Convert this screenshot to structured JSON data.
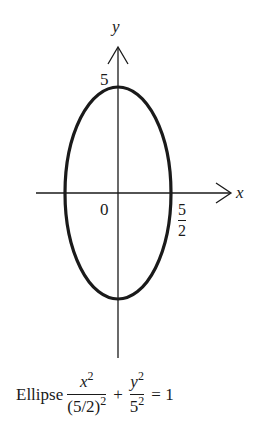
{
  "diagram": {
    "type": "ellipse-plot",
    "center": [
      0,
      0
    ],
    "semi_axis_x": 2.5,
    "semi_axis_y": 5,
    "axes": {
      "x_label": "x",
      "y_label": "y",
      "origin_label": "0"
    },
    "annotations": {
      "y_intercept_label": "5",
      "x_intercept_numerator": "5",
      "x_intercept_denominator": "2"
    },
    "colors": {
      "curve": "#1a1a1a",
      "axes": "#1a1a1a",
      "background": "#ffffff"
    }
  },
  "caption": {
    "word": "Ellipse",
    "term1_num_var": "x",
    "term1_num_exp": "2",
    "term1_den_base": "(5/2)",
    "term1_den_exp": "2",
    "plus": "+",
    "term2_num_var": "y",
    "term2_num_exp": "2",
    "term2_den_base": "5",
    "term2_den_exp": "2",
    "equals": "= 1"
  }
}
